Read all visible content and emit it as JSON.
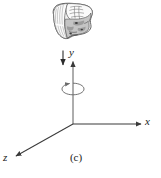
{
  "figure": {
    "caption": "(c)",
    "background_color": "#ffffff",
    "line_color": "#3a3a3a",
    "text_color": "#1a1a1a",
    "width": 161,
    "height": 178
  },
  "axes": {
    "y": {
      "label": "y",
      "direction": "vertical-up",
      "arrow": "up",
      "origin": [
        73,
        124
      ],
      "tip": [
        73,
        60
      ]
    },
    "x": {
      "label": "x",
      "direction": "horizontal-right",
      "arrow": "right",
      "origin": [
        73,
        124
      ],
      "tip": [
        143,
        124
      ]
    },
    "z": {
      "label": "z",
      "direction": "diagonal-down-left",
      "arrow": "down-left",
      "origin": [
        73,
        124
      ],
      "tip": [
        14,
        157
      ]
    }
  },
  "annotations": {
    "force_arrow": {
      "name": "downward-force-arrow",
      "direction": "down",
      "from": [
        63,
        51
      ],
      "to": [
        63,
        66
      ]
    },
    "rotation_ellipse": {
      "name": "rotation-about-y-axis",
      "center": [
        73,
        89
      ],
      "rx": 11,
      "ry": 6,
      "arrow": "counter-clockwise"
    }
  },
  "illustration": {
    "name": "hand-sketch",
    "description": "grayscale sketch of a hand gripping",
    "bounds": [
      50,
      2,
      45,
      40
    ],
    "fill_light": "#efefef",
    "fill_mid": "#c9c9c9",
    "fill_dark": "#9a9a9a",
    "outline": "#4a4a4a"
  }
}
